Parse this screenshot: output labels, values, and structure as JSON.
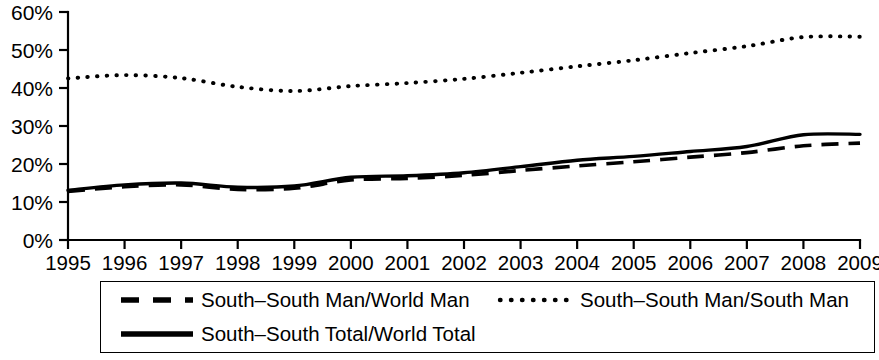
{
  "chart_data": {
    "type": "line",
    "title": "",
    "subtitle": "",
    "xlabel": "",
    "ylabel": "",
    "xlim": [
      1995,
      2009
    ],
    "ylim": [
      0,
      60
    ],
    "ytick_values": [
      0,
      10,
      20,
      30,
      40,
      50,
      60
    ],
    "ytick_labels": [
      "0%",
      "10%",
      "20%",
      "30%",
      "40%",
      "50%",
      "60%"
    ],
    "grid": false,
    "legend_position": "bottom",
    "x": [
      1995,
      1996,
      1997,
      1998,
      1999,
      2000,
      2001,
      2002,
      2003,
      2004,
      2005,
      2006,
      2007,
      2008,
      2009
    ],
    "categories": [
      "1995",
      "1996",
      "1997",
      "1998",
      "1999",
      "2000",
      "2001",
      "2002",
      "2003",
      "2004",
      "2005",
      "2006",
      "2007",
      "2008",
      "2009"
    ],
    "series": [
      {
        "name": "South–South Man/World Man",
        "style": "dashed",
        "color": "#000000",
        "values": [
          12.8,
          14.0,
          14.5,
          13.3,
          13.6,
          15.8,
          16.2,
          17.0,
          18.3,
          19.5,
          20.6,
          21.8,
          23.0,
          24.8,
          25.5
        ]
      },
      {
        "name": "South–South Man/South Man",
        "style": "dotted",
        "color": "#000000",
        "values": [
          42.5,
          43.4,
          42.6,
          40.3,
          39.2,
          40.5,
          41.3,
          42.4,
          44.0,
          45.7,
          47.3,
          49.2,
          51.0,
          53.4,
          53.5
        ]
      },
      {
        "name": "South–South Total/World Total",
        "style": "solid",
        "color": "#000000",
        "values": [
          13.1,
          14.5,
          15.0,
          13.9,
          14.2,
          16.5,
          16.9,
          17.7,
          19.3,
          21.0,
          22.0,
          23.3,
          24.6,
          27.7,
          27.8
        ]
      }
    ]
  },
  "axes": {
    "y_labels": [
      "60%",
      "50%",
      "40%",
      "30%",
      "20%",
      "10%",
      "0%"
    ],
    "x_labels": [
      "1995",
      "1996",
      "1997",
      "1998",
      "1999",
      "2000",
      "2001",
      "2002",
      "2003",
      "2004",
      "2005",
      "2006",
      "2007",
      "2008",
      "2009"
    ]
  },
  "legend": {
    "entries": [
      {
        "label": "South–South Man/World Man",
        "style": "dashed"
      },
      {
        "label": "South–South Man/South Man",
        "style": "dotted"
      },
      {
        "label": "South–South Total/World Total",
        "style": "solid"
      }
    ]
  }
}
